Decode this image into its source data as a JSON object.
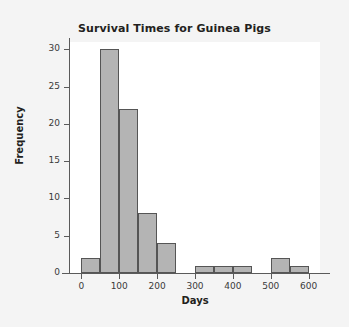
{
  "chart_data": {
    "type": "bar",
    "title": "Survival Times for Guinea Pigs",
    "xlabel": "Days",
    "ylabel": "Frequency",
    "bin_width": 50,
    "bin_starts": [
      0,
      50,
      100,
      150,
      200,
      250,
      300,
      350,
      400,
      450,
      500,
      550
    ],
    "bin_ends": [
      50,
      100,
      150,
      200,
      250,
      300,
      350,
      400,
      450,
      500,
      550,
      600
    ],
    "categories": [
      "0-50",
      "50-100",
      "100-150",
      "150-200",
      "200-250",
      "250-300",
      "300-350",
      "350-400",
      "400-450",
      "450-500",
      "500-550",
      "550-600"
    ],
    "values": [
      2,
      30,
      22,
      8,
      4,
      0,
      1,
      1,
      1,
      0,
      2,
      1
    ],
    "xlim": [
      -30,
      630
    ],
    "ylim": [
      0,
      31
    ],
    "x_ticks": [
      0,
      100,
      200,
      300,
      400,
      500,
      600
    ],
    "x_tick_labels": [
      "0",
      "100",
      "200",
      "300",
      "400",
      "500",
      "600"
    ],
    "y_ticks": [
      0,
      5,
      10,
      15,
      20,
      25,
      30
    ],
    "y_tick_labels": [
      "0",
      "5",
      "10",
      "15",
      "20",
      "25",
      "30"
    ],
    "grid": false,
    "legend": false,
    "bar_color": "#b4b4b4",
    "bar_edge_color": "#555555",
    "plot_background": "#ffffff",
    "figure_background": "#f4f4f4",
    "text_color": "#231f20"
  }
}
